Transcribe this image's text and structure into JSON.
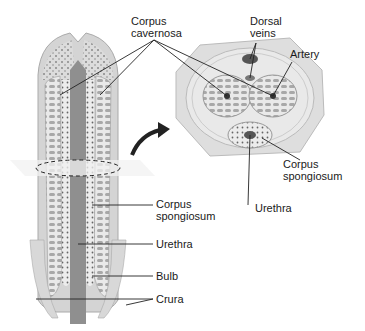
{
  "diagram": {
    "type": "anatomical-diagram",
    "views": [
      "longitudinal-section",
      "cross-section"
    ],
    "labels": {
      "corpus_cavernosa_1": "Corpus",
      "corpus_cavernosa_2": "cavernosa",
      "dorsal_veins_1": "Dorsal",
      "dorsal_veins_2": "veins",
      "artery": "Artery",
      "cross_corpus_spongiosum_1": "Corpus",
      "cross_corpus_spongiosum_2": "spongiosum",
      "cross_urethra": "Urethra",
      "long_corpus_spongiosum_1": "Corpus",
      "long_corpus_spongiosum_2": "spongiosum",
      "long_urethra": "Urethra",
      "bulb": "Bulb",
      "crura": "Crura"
    },
    "colors": {
      "outer_tissue": "#cfcfcf",
      "inner_tissue": "#e6e6e6",
      "cavernous": "#b5b5b5",
      "urethra": "#8a8a8a",
      "leader_line": "#222222",
      "arrow": "#222222"
    }
  }
}
